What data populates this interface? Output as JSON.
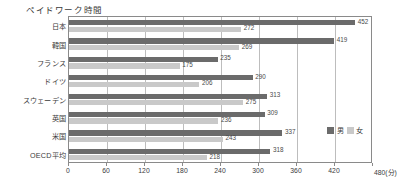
{
  "chart_data": {
    "type": "bar",
    "orientation": "horizontal",
    "title": "ペイドワーク時間",
    "xlabel": "",
    "ylabel": "",
    "unit_label": "480(分)",
    "unit_suffix": "(分)",
    "xlim": [
      0,
      480
    ],
    "xticks": [
      0,
      60,
      120,
      180,
      240,
      300,
      360,
      420,
      480
    ],
    "xticklabels": [
      "0",
      "60",
      "120",
      "180",
      "240",
      "300",
      "360",
      "420",
      "480"
    ],
    "grid": true,
    "grid_axis": "x",
    "legend_position": "right-middle",
    "categories": [
      "日本",
      "韓国",
      "フランス",
      "ドイツ",
      "スウェーデン",
      "英国",
      "米国",
      "OECD平均"
    ],
    "series": [
      {
        "name": "男",
        "color": "#6b6b6b",
        "values": [
          452,
          419,
          235,
          290,
          313,
          309,
          337,
          318
        ]
      },
      {
        "name": "女",
        "color": "#c9c9c9",
        "values": [
          272,
          269,
          175,
          206,
          275,
          236,
          243,
          218
        ]
      }
    ]
  },
  "colors": {
    "male": "#6b6b6b",
    "female": "#c9c9c9",
    "frame": "#8a8a8a",
    "grid": "#bdbdbd",
    "text": "#3a3a3a",
    "background": "#ffffff"
  }
}
